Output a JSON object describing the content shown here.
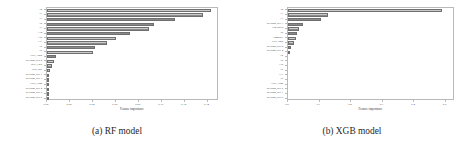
{
  "figure": {
    "panels": [
      {
        "caption": "(a) RF model",
        "chart_data": {
          "type": "bar",
          "orientation": "horizontal",
          "title": "",
          "xlabel": "Feature importance",
          "ylabel": "",
          "xlim": [
            0.0,
            0.15
          ],
          "xticks": [
            "0.00",
            "0.02",
            "0.04",
            "0.06",
            "0.08",
            "0.10",
            "0.12",
            "0.14"
          ],
          "xtick_values": [
            0.0,
            0.02,
            0.04,
            0.06,
            0.08,
            0.1,
            0.12,
            0.14
          ],
          "grid": false,
          "legend": "none",
          "categories": [
            "T4",
            "T1",
            "T3",
            "T9",
            "T7",
            "T14",
            "T12",
            "T13",
            "T8",
            "T5",
            "CPU_Load",
            "Revision_Rev 2",
            "BNF_Low",
            "Heat_Incl",
            "Revision_Rev 1",
            "Revision_Rev 3",
            "GDP_High",
            "Revision_Rev 4",
            "Revision_Rev 6",
            "Revision_Rev 5"
          ],
          "values": [
            0.143,
            0.136,
            0.112,
            0.093,
            0.089,
            0.072,
            0.06,
            0.052,
            0.042,
            0.04,
            0.0075,
            0.006,
            0.004,
            0.0022,
            0.0016,
            0.0012,
            0.001,
            0.0006,
            0.0004,
            0.0003
          ]
        }
      },
      {
        "caption": "(b) XGB model",
        "chart_data": {
          "type": "bar",
          "orientation": "horizontal",
          "title": "",
          "xlabel": "Feature importance",
          "ylabel": "",
          "xlim": [
            0.0,
            0.53
          ],
          "xticks": [
            "0.0",
            "0.1",
            "0.2",
            "0.3",
            "0.4",
            "0.5"
          ],
          "xtick_values": [
            0.0,
            0.1,
            0.2,
            0.3,
            0.4,
            0.5
          ],
          "grid": false,
          "legend": "none",
          "categories": [
            "T4",
            "T1",
            "T3",
            "Revision_Rev 3",
            "Fan Speed",
            "T9",
            "Humidity",
            "CPU Load",
            "Revision_Rev 2",
            "Revision_Rev 4",
            "T2",
            "T8",
            "T10",
            "T5",
            "T13",
            "T6",
            "GDP_High",
            "Revision_Rev 5",
            "Revision_Rev 1",
            "Revision_Rev 6"
          ],
          "values": [
            0.49,
            0.128,
            0.106,
            0.047,
            0.036,
            0.03,
            0.024,
            0.02,
            0.0085,
            0.007,
            0.0,
            0.0,
            0.0,
            0.0,
            0.0,
            0.0,
            0.0,
            0.0,
            0.0,
            0.0
          ]
        }
      }
    ]
  }
}
